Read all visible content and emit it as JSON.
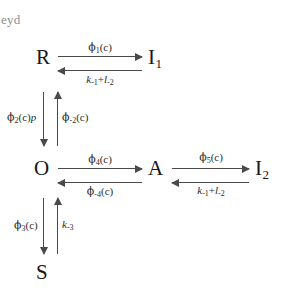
{
  "corner_text": "eyd",
  "diagram": {
    "type": "reaction-scheme",
    "nodes": [
      {
        "id": "R",
        "label": "R",
        "sub": ""
      },
      {
        "id": "I1",
        "label": "I",
        "sub": "1"
      },
      {
        "id": "O",
        "label": "O",
        "sub": ""
      },
      {
        "id": "A",
        "label": "A",
        "sub": ""
      },
      {
        "id": "I2",
        "label": "I",
        "sub": "2"
      },
      {
        "id": "S",
        "label": "S",
        "sub": ""
      }
    ],
    "labels": {
      "phi1": {
        "symbol": "ϕ",
        "sub": "1",
        "arg": "(c)"
      },
      "k1l2_top": {
        "k": "k",
        "ksub": "-1",
        "plus": "+",
        "l": "l",
        "lsub": "-2"
      },
      "phi4": {
        "symbol": "ϕ",
        "sub": "4",
        "arg": "(c)"
      },
      "phi_minus4": {
        "symbol": "ϕ",
        "sub": "-4",
        "arg": "(c)"
      },
      "phi5": {
        "symbol": "ϕ",
        "sub": "5",
        "arg": "(c)"
      },
      "k1l2_right": {
        "k": "k",
        "ksub": "-1",
        "plus": "+",
        "l": "l",
        "lsub": "-2"
      },
      "phi2p": {
        "symbol": "ϕ",
        "sub": "2",
        "arg": "(c)",
        "factor": "p"
      },
      "phi_minus2": {
        "symbol": "ϕ",
        "sub": "-2",
        "arg": "(c)"
      },
      "phi3": {
        "symbol": "ϕ",
        "sub": "3",
        "arg": "(c)"
      },
      "k_minus3": {
        "k": "k",
        "ksub": "-3"
      }
    },
    "colors": {
      "arrow": "#4a4a4a",
      "text": "#171717",
      "corner_text": "#8d8d8d",
      "background": "#ffffff"
    }
  }
}
